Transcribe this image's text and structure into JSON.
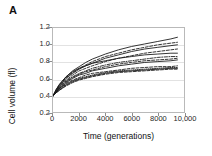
{
  "panel": {
    "label": "A"
  },
  "axes": {
    "x": {
      "label": "Time (generations)",
      "ticks": [
        "0",
        "2000",
        "4000",
        "6000",
        "8000",
        "10,000"
      ],
      "tick_values": [
        0,
        2000,
        4000,
        6000,
        8000,
        10000
      ],
      "min": 0,
      "max": 10000
    },
    "y": {
      "label": "Cell volume (fl)",
      "ticks": [
        "0.2",
        "0.4",
        "0.6",
        "0.8",
        "1.0",
        "1.2"
      ],
      "tick_values": [
        0.2,
        0.4,
        0.6,
        0.8,
        1.0,
        1.2
      ],
      "min": 0.2,
      "max": 1.2
    },
    "grid": "horizontal"
  },
  "style": {
    "frame_color": "#b9b9b9",
    "grid_color": "#e2e2e2",
    "line_color": "#1a1a1a",
    "background": "#ffffff"
  },
  "chart_data": {
    "type": "line",
    "title": "",
    "xlabel": "Time (generations)",
    "ylabel": "Cell volume (fl)",
    "xlim": [
      0,
      10000
    ],
    "ylim": [
      0.2,
      1.2
    ],
    "grid": true,
    "legend": "none",
    "x": [
      0,
      250,
      500,
      1000,
      1500,
      2000,
      2500,
      3000,
      4000,
      5000,
      6000,
      7000,
      8000,
      9000,
      9500
    ],
    "series": [
      {
        "name": "population-1",
        "dash": "solid",
        "values": [
          0.39,
          0.47,
          0.53,
          0.62,
          0.69,
          0.74,
          0.79,
          0.83,
          0.89,
          0.94,
          0.98,
          1.01,
          1.04,
          1.07,
          1.09
        ]
      },
      {
        "name": "population-2",
        "dash": "dashed",
        "values": [
          0.39,
          0.46,
          0.52,
          0.61,
          0.67,
          0.72,
          0.76,
          0.8,
          0.86,
          0.9,
          0.94,
          0.97,
          1.0,
          1.02,
          1.03
        ]
      },
      {
        "name": "population-3",
        "dash": "solid",
        "values": [
          0.39,
          0.46,
          0.51,
          0.6,
          0.66,
          0.71,
          0.75,
          0.78,
          0.84,
          0.88,
          0.92,
          0.95,
          0.97,
          0.99,
          1.0
        ]
      },
      {
        "name": "population-4",
        "dash": "dashed",
        "values": [
          0.39,
          0.45,
          0.5,
          0.58,
          0.64,
          0.69,
          0.72,
          0.75,
          0.8,
          0.84,
          0.87,
          0.9,
          0.92,
          0.94,
          0.95
        ]
      },
      {
        "name": "population-5",
        "dash": "solid",
        "values": [
          0.39,
          0.47,
          0.53,
          0.62,
          0.68,
          0.72,
          0.75,
          0.78,
          0.81,
          0.84,
          0.86,
          0.88,
          0.89,
          0.9,
          0.9
        ]
      },
      {
        "name": "population-6",
        "dash": "dashdot",
        "values": [
          0.39,
          0.45,
          0.5,
          0.57,
          0.62,
          0.66,
          0.69,
          0.72,
          0.76,
          0.79,
          0.81,
          0.83,
          0.85,
          0.86,
          0.86
        ]
      },
      {
        "name": "population-7",
        "dash": "dashed",
        "values": [
          0.39,
          0.44,
          0.49,
          0.56,
          0.61,
          0.65,
          0.68,
          0.7,
          0.74,
          0.77,
          0.79,
          0.81,
          0.82,
          0.83,
          0.84
        ]
      },
      {
        "name": "population-8",
        "dash": "solid",
        "values": [
          0.39,
          0.44,
          0.48,
          0.55,
          0.6,
          0.64,
          0.66,
          0.69,
          0.72,
          0.75,
          0.77,
          0.79,
          0.8,
          0.81,
          0.82
        ]
      },
      {
        "name": "population-9",
        "dash": "dashed",
        "values": [
          0.39,
          0.44,
          0.48,
          0.54,
          0.58,
          0.61,
          0.64,
          0.66,
          0.68,
          0.7,
          0.72,
          0.73,
          0.74,
          0.74,
          0.75
        ]
      },
      {
        "name": "population-10",
        "dash": "dotted",
        "values": [
          0.39,
          0.43,
          0.47,
          0.53,
          0.57,
          0.6,
          0.62,
          0.64,
          0.67,
          0.69,
          0.7,
          0.71,
          0.72,
          0.73,
          0.73
        ]
      },
      {
        "name": "population-11",
        "dash": "solid",
        "values": [
          0.39,
          0.43,
          0.46,
          0.52,
          0.56,
          0.59,
          0.61,
          0.63,
          0.66,
          0.68,
          0.69,
          0.7,
          0.71,
          0.72,
          0.72
        ]
      },
      {
        "name": "population-12",
        "dash": "dashed",
        "values": [
          0.39,
          0.43,
          0.46,
          0.51,
          0.55,
          0.58,
          0.6,
          0.62,
          0.65,
          0.67,
          0.68,
          0.69,
          0.7,
          0.71,
          0.71
        ]
      }
    ]
  }
}
